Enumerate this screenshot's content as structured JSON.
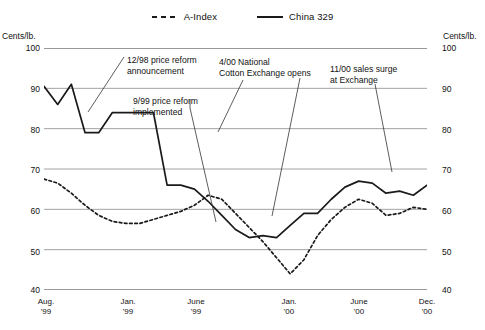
{
  "legend": {
    "items": [
      {
        "label": "A-Index",
        "style": "dashed",
        "color": "#1a1a1a"
      },
      {
        "label": "China 329",
        "style": "solid",
        "color": "#1a1a1a"
      }
    ]
  },
  "axis": {
    "unit_left": "Cents/lb.",
    "unit_right": "Cents/lb.",
    "y_ticks": [
      "100",
      "90",
      "80",
      "70",
      "60",
      "50",
      "40"
    ],
    "x_ticks": [
      {
        "month": "Aug.",
        "year": "'99"
      },
      {
        "month": "Jan.",
        "year": "'99"
      },
      {
        "month": "June",
        "year": "'99"
      },
      {
        "month": "Jan.",
        "year": "'00"
      },
      {
        "month": "June",
        "year": "'00"
      },
      {
        "month": "Dec.",
        "year": "'00"
      }
    ]
  },
  "annotations": [
    {
      "line1": "12/98 price reform",
      "line2": "announcement"
    },
    {
      "line1": "9/99 price reform",
      "line2": "implemented"
    },
    {
      "line1": "4/00 National",
      "line2": "Cotton Exchange opens"
    },
    {
      "line1": "11/00 sales surge",
      "line2": "at Exchange"
    }
  ],
  "chart_data": {
    "type": "line",
    "title": "",
    "xlabel": "",
    "ylabel": "Cents/lb.",
    "ylim": [
      40,
      100
    ],
    "y_gridlines": [
      40,
      50,
      60,
      70,
      80,
      90,
      100
    ],
    "grid": true,
    "legend_position": "top-center",
    "x": [
      "1998-08",
      "1998-09",
      "1998-10",
      "1998-11",
      "1998-12",
      "1999-01",
      "1999-02",
      "1999-03",
      "1999-04",
      "1999-05",
      "1999-06",
      "1999-07",
      "1999-08",
      "1999-09",
      "1999-10",
      "1999-11",
      "1999-12",
      "2000-01",
      "2000-02",
      "2000-03",
      "2000-04",
      "2000-05",
      "2000-06",
      "2000-07",
      "2000-08",
      "2000-09",
      "2000-10",
      "2000-11",
      "2000-12"
    ],
    "series": [
      {
        "name": "China 329",
        "style": "solid",
        "color": "#1a1a1a",
        "values": [
          90.5,
          86.0,
          91.0,
          79.0,
          79.0,
          84.0,
          84.0,
          84.0,
          84.0,
          66.0,
          66.0,
          65.0,
          62.0,
          58.5,
          55.0,
          53.0,
          53.5,
          53.0,
          56.0,
          59.0,
          59.0,
          62.5,
          65.5,
          67.0,
          66.5,
          64.0,
          64.5,
          63.5,
          66.0
        ]
      },
      {
        "name": "A-Index",
        "style": "dashed",
        "color": "#1a1a1a",
        "values": [
          67.5,
          66.5,
          64.0,
          61.0,
          58.5,
          57.0,
          56.5,
          56.5,
          57.5,
          58.5,
          59.5,
          61.0,
          63.5,
          62.5,
          59.0,
          55.5,
          52.0,
          48.0,
          44.0,
          47.5,
          53.5,
          57.5,
          60.5,
          62.5,
          61.5,
          58.5,
          59.0,
          60.5,
          60.0
        ]
      }
    ],
    "annotations": [
      {
        "text": "12/98 price reform announcement",
        "points_to_x": "1998-12"
      },
      {
        "text": "9/99 price reform implemented",
        "points_to_x": "1999-09"
      },
      {
        "text": "4/00 National Cotton Exchange opens",
        "points_to_x": "2000-04"
      },
      {
        "text": "11/00 sales surge at Exchange",
        "points_to_x": "2000-11"
      }
    ]
  }
}
